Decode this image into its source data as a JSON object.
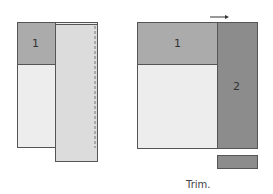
{
  "figure": {
    "left_panel": {
      "cell_1_label": "1"
    },
    "right_panel": {
      "cell_1_label": "1",
      "cell_2_label": "2"
    },
    "caption": "Trim."
  },
  "colors": {
    "border": "#555555",
    "light_fill": "#ededed",
    "strip_fill": "#dcdcdc",
    "medium_fill": "#ababab",
    "dark_fill": "#8c8c8c",
    "dashed_line": "#777777",
    "arrow": "#333333"
  }
}
